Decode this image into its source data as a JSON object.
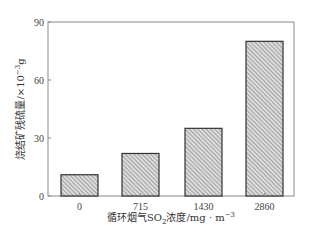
{
  "chart_data": {
    "type": "bar",
    "title": "",
    "categories": [
      "0",
      "715",
      "1430",
      "2860"
    ],
    "values": [
      11,
      22,
      35,
      80
    ],
    "xlabel": "循环烟气SO₂浓度/mg·m⁻³",
    "ylabel": "烧结矿残硫量/×10⁻³g",
    "ylim": [
      0,
      90
    ],
    "yticks": [
      0,
      30,
      60,
      90
    ],
    "grid": false,
    "legend": null,
    "bar_style": "diagonal-hatch",
    "colors": {
      "bar_fill": "#d9d9d9",
      "hatch": "#7a7a7a",
      "bar_edge": "#333333",
      "axis": "#888888"
    }
  },
  "axes": {
    "x_label_parts": {
      "prefix": "循环烟气SO",
      "sub": "2",
      "middle": "浓度/mg · m",
      "sup": "−3"
    },
    "y_label_parts": {
      "prefix": "烧结矿残硫量/×10",
      "sup": "−3",
      "suffix": "g"
    }
  }
}
